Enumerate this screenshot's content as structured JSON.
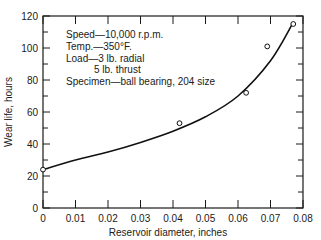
{
  "chart_data": {
    "type": "scatter",
    "title": "",
    "xlabel": "Reservoir diameter, inches",
    "ylabel": "Wear life, hours",
    "xlim": [
      0,
      0.08
    ],
    "ylim": [
      0,
      120
    ],
    "x_ticks": [
      0,
      0.01,
      0.02,
      0.03,
      0.04,
      0.05,
      0.06,
      0.07,
      0.08
    ],
    "x_tick_labels": [
      "0",
      "0.01",
      "0.02",
      "0.03",
      "0.04",
      "0.05",
      "0.06",
      "0.07",
      "0.08"
    ],
    "y_ticks": [
      0,
      20,
      40,
      60,
      80,
      100,
      120
    ],
    "y_tick_labels": [
      "0",
      "20",
      "40",
      "60",
      "80",
      "100",
      "120"
    ],
    "grid": false,
    "legend": null,
    "series": [
      {
        "name": "Measured",
        "marker": "open-circle",
        "x": [
          0,
          0.042,
          0.0625,
          0.069,
          0.077
        ],
        "y": [
          24,
          53,
          72,
          101,
          115
        ]
      },
      {
        "name": "Fitted curve",
        "style": "solid-line",
        "x": [
          0,
          0.01,
          0.02,
          0.03,
          0.04,
          0.05,
          0.06,
          0.07,
          0.077
        ],
        "y": [
          24,
          30,
          35,
          41,
          48,
          57,
          70,
          92,
          116
        ]
      }
    ],
    "annotations": [
      "Speed—10,000 r.p.m.",
      "Temp.—350°F.",
      "Load—3 lb. radial",
      "5 lb. thrust",
      "Specimen—ball bearing, 204 size"
    ]
  }
}
